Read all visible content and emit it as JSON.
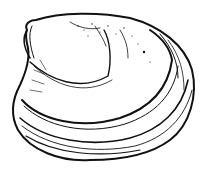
{
  "image": {
    "subject": "clam shell line drawing",
    "background_color": "#ffffff",
    "ink_color": "#111111"
  }
}
